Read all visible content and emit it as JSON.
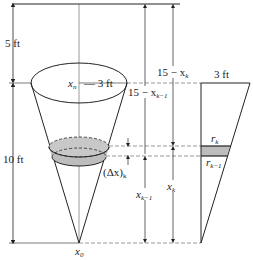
{
  "figure": {
    "type": "cone tank pumping diagram",
    "labels": {
      "top_height": "5 ft",
      "cone_height": "10 ft",
      "radius_label_var": "x",
      "radius_label_var_sub": "n",
      "radius_label_value": "— 3 ft",
      "apex_label_var": "x",
      "apex_label_sub": "0",
      "dist_k": "15 − x",
      "dist_k_sub": "k",
      "dist_k1": "15 − x",
      "dist_k1_sub": "k−1",
      "delta_x": "(Δx)",
      "delta_x_sub": "k",
      "x_k": "x",
      "x_k_sub": "k",
      "x_k1": "x",
      "x_k1_sub": "k−1",
      "cross_section_top": "3 ft",
      "r_k": "r",
      "r_k_sub": "k",
      "r_k1": "r",
      "r_k1_sub": "k−1"
    },
    "colors": {
      "stroke": "#222222",
      "shade": "#bdbdbd",
      "dash": "#555555"
    }
  }
}
